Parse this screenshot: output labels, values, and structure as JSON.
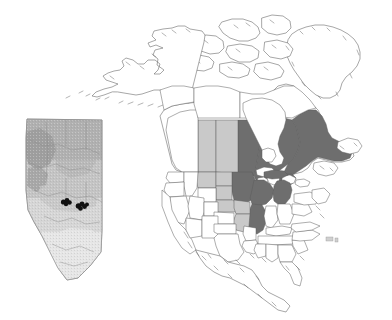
{
  "figure": {
    "description": "Outline map of North America with shaded provinces and states, and an inset relief map of Alberta marked with black study-site points.",
    "background_color": "#ffffff",
    "width": 392,
    "height": 320
  },
  "legend_colors": {
    "dark_fill": "#6e6e6e",
    "light_fill": "#c9c9c9",
    "no_fill": "#ffffff",
    "outline": "#5d5d5d",
    "site_dot": "#111111"
  },
  "main_map": {
    "name": "north-america-outline-map",
    "projection_hint": "conic",
    "regions_dark": [
      {
        "code": "MB",
        "label": "Manitoba",
        "shade": "dark"
      },
      {
        "code": "ON",
        "label": "Ontario",
        "shade": "dark"
      },
      {
        "code": "QC",
        "label": "Quebec",
        "shade": "dark"
      },
      {
        "code": "MN",
        "label": "Minnesota",
        "shade": "dark"
      },
      {
        "code": "WI",
        "label": "Wisconsin",
        "shade": "dark"
      },
      {
        "code": "MI",
        "label": "Michigan",
        "shade": "dark"
      },
      {
        "code": "IL",
        "label": "Illinois",
        "shade": "dark"
      }
    ],
    "regions_light": [
      {
        "code": "AB",
        "label": "Alberta",
        "shade": "light"
      },
      {
        "code": "SK",
        "label": "Saskatchewan",
        "shade": "light"
      },
      {
        "code": "MT",
        "label": "Montana",
        "shade": "light"
      },
      {
        "code": "ND",
        "label": "North Dakota",
        "shade": "light"
      },
      {
        "code": "SD",
        "label": "South Dakota",
        "shade": "light"
      },
      {
        "code": "NE",
        "label": "Nebraska",
        "shade": "light"
      },
      {
        "code": "IA",
        "label": "Iowa",
        "shade": "light"
      },
      {
        "code": "MO",
        "label": "Missouri",
        "shade": "light"
      }
    ],
    "regions_unshaded": [
      {
        "code": "BC",
        "label": "British Columbia",
        "shade": "none"
      },
      {
        "code": "YT",
        "label": "Yukon",
        "shade": "none"
      },
      {
        "code": "NT",
        "label": "Northwest Territories",
        "shade": "none"
      },
      {
        "code": "NU",
        "label": "Nunavut",
        "shade": "none"
      },
      {
        "code": "AK",
        "label": "Alaska",
        "shade": "none"
      },
      {
        "code": "GL",
        "label": "Greenland",
        "shade": "none"
      },
      {
        "code": "MX",
        "label": "Mexico",
        "shade": "none"
      }
    ],
    "water_bodies": [
      {
        "label": "Hudson Bay"
      },
      {
        "label": "Great Lakes"
      }
    ]
  },
  "inset_map": {
    "name": "alberta-relief-inset",
    "region_label": "Alberta",
    "frame": {
      "x": 26,
      "y": 118,
      "width": 78,
      "height": 162
    },
    "relief_bands": [
      {
        "label": "high-relief-northwest",
        "color": "#9b9b9b"
      },
      {
        "label": "upland",
        "color": "#b0b0b0"
      },
      {
        "label": "mid-plain",
        "color": "#c4c4c4"
      },
      {
        "label": "lower-plain",
        "color": "#d6d6d6"
      },
      {
        "label": "southern-prairie",
        "color": "#e6e6e6"
      }
    ],
    "site_points": [
      {
        "id": 1,
        "x": 63.5,
        "y": 202.0,
        "r": 2.6
      },
      {
        "id": 2,
        "x": 67.0,
        "y": 200.5,
        "r": 2.4
      },
      {
        "id": 3,
        "x": 69.5,
        "y": 202.5,
        "r": 2.3
      },
      {
        "id": 4,
        "x": 66.0,
        "y": 204.0,
        "r": 2.2
      },
      {
        "id": 5,
        "x": 78.5,
        "y": 206.0,
        "r": 2.8
      },
      {
        "id": 6,
        "x": 82.0,
        "y": 204.0,
        "r": 2.5
      },
      {
        "id": 7,
        "x": 84.5,
        "y": 206.5,
        "r": 2.4
      },
      {
        "id": 8,
        "x": 80.5,
        "y": 208.5,
        "r": 2.3
      },
      {
        "id": 9,
        "x": 87.0,
        "y": 204.5,
        "r": 2.0
      }
    ],
    "site_point_count": 9
  },
  "annotations": {
    "small_island_mark": {
      "label": "bermuda-islands",
      "x": 330,
      "y": 240
    }
  }
}
